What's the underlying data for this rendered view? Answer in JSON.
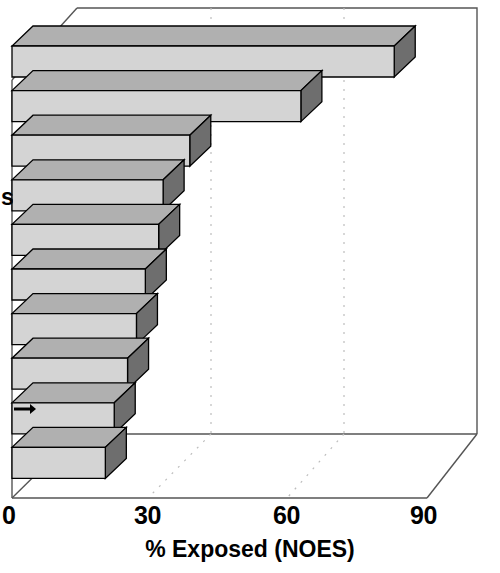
{
  "chart_data": {
    "type": "bar",
    "orientation": "horizontal",
    "style": "3d-extruded",
    "title": "",
    "xlabel": "% Exposed (NOES)",
    "ylabel": "s",
    "xlim": [
      0,
      90
    ],
    "xticks": [
      0,
      30,
      60,
      90
    ],
    "xtick_labels": [
      "0",
      "30",
      "60",
      "90"
    ],
    "grid": "dotted-back-wall-verticals",
    "legend": "none",
    "categories": [
      "",
      "",
      "",
      "",
      "",
      "",
      "",
      "",
      "",
      ""
    ],
    "values": [
      86,
      65,
      40,
      34,
      33,
      30,
      28,
      26,
      23,
      21
    ],
    "bar_count": 10,
    "annotation": "tick-marker-at-bar-9",
    "colors": {
      "bar_front": "#d4d4d4",
      "bar_top": "#b0b0b0",
      "bar_side": "#6e6e6e",
      "outline": "#000000",
      "axis": "#555555",
      "grid": "#b8b8b8",
      "background": "#ffffff",
      "text": "#000000"
    }
  },
  "axis": {
    "x_title": "% Exposed (NOES)",
    "y_title": "s",
    "ticks": [
      {
        "label": "0",
        "value": 0,
        "px": 2
      },
      {
        "label": "30",
        "value": 30,
        "px": 134
      },
      {
        "label": "60",
        "value": 60,
        "px": 273
      },
      {
        "label": "90",
        "value": 90,
        "px": 410
      }
    ]
  }
}
